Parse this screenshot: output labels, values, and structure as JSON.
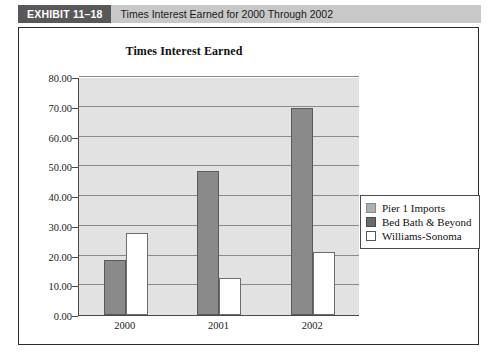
{
  "exhibit": {
    "tag": "EXHIBIT 11–18",
    "title": "Times Interest Earned for 2000 Through 2002"
  },
  "chart_data": {
    "type": "bar",
    "title": "Times Interest Earned",
    "xlabel": "",
    "ylabel": "",
    "categories": [
      "2000",
      "2001",
      "2002"
    ],
    "series": [
      {
        "name": "Pier 1 Imports",
        "color": "#d9d9d9",
        "values": [
          0.0,
          0.0,
          0.0
        ]
      },
      {
        "name": "Bed Bath & Beyond",
        "color": "#8a8a8a",
        "values": [
          18.5,
          48.3,
          69.6
        ]
      },
      {
        "name": "Williams-Sonoma",
        "color": "#ffffff",
        "values": [
          27.5,
          12.3,
          21.1
        ]
      }
    ],
    "ylim": [
      0,
      80
    ],
    "ytick_step": 10,
    "yticks": [
      "0.00",
      "10.00",
      "20.00",
      "30.00",
      "40.00",
      "50.00",
      "60.00",
      "70.00",
      "80.00"
    ],
    "grid": true,
    "legend_position": "right",
    "plot_background": "#e2e2e2"
  }
}
